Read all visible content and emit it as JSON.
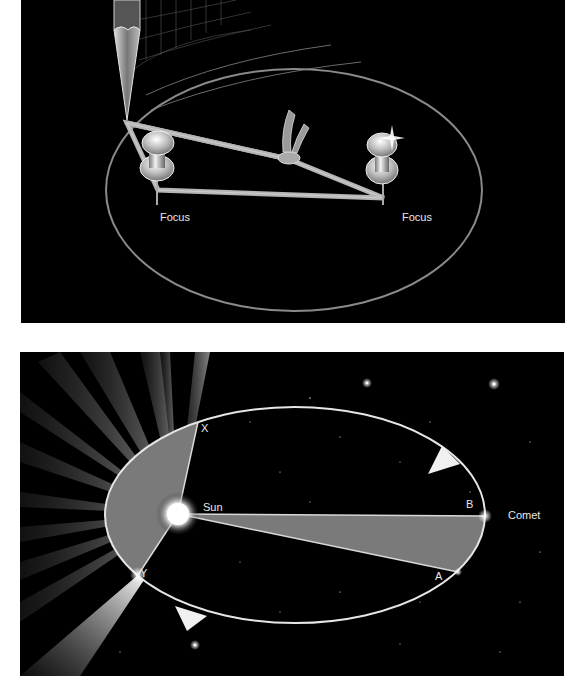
{
  "figure_top": {
    "title": "Drawing an ellipse with a string and two pins",
    "labels": {
      "focus_left": "Focus",
      "focus_right": "Focus"
    },
    "colors": {
      "background": "#000000",
      "ellipse": "#8a8a8a",
      "string": "#b8b8b8"
    }
  },
  "figure_bottom": {
    "title": "Comet orbit with equal swept areas",
    "labels": {
      "sun": "Sun",
      "comet": "Comet",
      "point_x": "X",
      "point_y": "Y",
      "point_a": "A",
      "point_b": "B"
    },
    "colors": {
      "background": "#000000",
      "orbit": "#e6e6e6",
      "swept_area": "#7a7a7a",
      "sun": "#ffffff"
    }
  }
}
